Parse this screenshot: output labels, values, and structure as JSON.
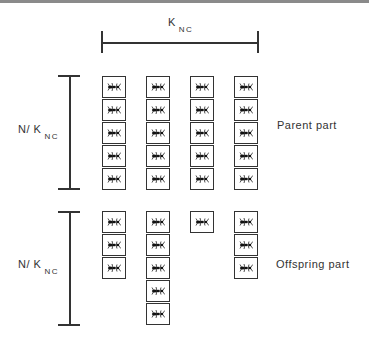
{
  "top_label": {
    "main": "K",
    "sub": "NC"
  },
  "left_labels": [
    {
      "main": "N/ K",
      "sub": "NC"
    },
    {
      "main": "N/ K",
      "sub": "NC"
    }
  ],
  "right_labels": {
    "parent": "Parent part",
    "offspring": "Offspring part"
  },
  "grid": {
    "columns": 4,
    "parent_counts": [
      5,
      5,
      5,
      5
    ],
    "offspring_counts": [
      3,
      5,
      1,
      3
    ],
    "cell_icon": "ant-icon"
  }
}
